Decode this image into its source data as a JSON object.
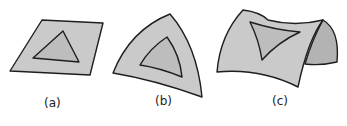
{
  "figure": {
    "panels": [
      {
        "id": "a",
        "label": "(a)",
        "description": "flat plane with triangle",
        "surface": "plane"
      },
      {
        "id": "b",
        "label": "(b)",
        "description": "spherical triangle surface with inner triangle",
        "surface": "sphere"
      },
      {
        "id": "c",
        "label": "(c)",
        "description": "saddle surface with triangle",
        "surface": "saddle"
      }
    ],
    "colors": {
      "surface_fill": "#cacaca",
      "triangle_fill": "#bdbdbd",
      "side_fill": "#b3b3b3",
      "stroke": "#1e1e1e",
      "background": "#ffffff"
    }
  }
}
